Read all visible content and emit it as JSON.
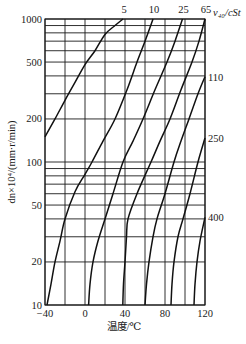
{
  "chart_data": {
    "type": "line",
    "title": "",
    "xlabel": "温度/℃",
    "ylabel": "dn×10⁴/(mm·r/min)",
    "xscale": "linear",
    "yscale": "log",
    "xlim": [
      -40,
      120
    ],
    "ylim": [
      10,
      1000
    ],
    "x_ticks": [
      -40,
      0,
      40,
      80,
      120
    ],
    "x_tick_labels": [
      "−40",
      "0",
      "40",
      "80",
      "120"
    ],
    "x_gridlines": [
      -40,
      -20,
      0,
      20,
      40,
      60,
      80,
      100,
      120
    ],
    "y_ticks": [
      10,
      20,
      50,
      100,
      200,
      500,
      1000
    ],
    "y_tick_labels": [
      "10",
      "20",
      "50",
      "100",
      "200",
      "500",
      "1000"
    ],
    "y_gridlines": [
      10,
      20,
      30,
      40,
      50,
      60,
      70,
      80,
      90,
      100,
      200,
      300,
      400,
      500,
      600,
      700,
      800,
      900,
      1000
    ],
    "grid": true,
    "legend_title": "ν₄₀/cSt",
    "series": [
      {
        "name": "5",
        "label_position": "top",
        "points": [
          [
            -40,
            150
          ],
          [
            -30,
            200
          ],
          [
            -20,
            270
          ],
          [
            -10,
            360
          ],
          [
            0,
            480
          ],
          [
            10,
            600
          ],
          [
            20,
            780
          ],
          [
            30,
            900
          ],
          [
            38,
            1000
          ]
        ]
      },
      {
        "name": "10",
        "label_position": "top",
        "points": [
          [
            -38,
            10
          ],
          [
            -34,
            14
          ],
          [
            -30,
            20
          ],
          [
            -25,
            28
          ],
          [
            -20,
            40
          ],
          [
            -10,
            62
          ],
          [
            0,
            82
          ],
          [
            7,
            100
          ],
          [
            18,
            140
          ],
          [
            30,
            200
          ],
          [
            42,
            320
          ],
          [
            52,
            500
          ],
          [
            60,
            700
          ],
          [
            68,
            1000
          ]
        ]
      },
      {
        "name": "25",
        "label_position": "top",
        "points": [
          [
            3.6,
            10
          ],
          [
            5,
            14
          ],
          [
            8,
            20
          ],
          [
            13,
            28
          ],
          [
            20,
            40
          ],
          [
            28,
            60
          ],
          [
            38,
            100
          ],
          [
            48,
            140
          ],
          [
            58,
            200
          ],
          [
            70,
            320
          ],
          [
            82,
            500
          ],
          [
            90,
            700
          ],
          [
            97.5,
            1000
          ]
        ]
      },
      {
        "name": "65",
        "label_position": "top",
        "points": [
          [
            37.8,
            10
          ],
          [
            38.5,
            14
          ],
          [
            40,
            20
          ],
          [
            41.5,
            30
          ],
          [
            43,
            40
          ],
          [
            52,
            60
          ],
          [
            66,
            100
          ],
          [
            75,
            140
          ],
          [
            85,
            200
          ],
          [
            96,
            320
          ],
          [
            107,
            500
          ],
          [
            114,
            700
          ],
          [
            120,
            1000
          ]
        ]
      },
      {
        "name": "110",
        "label_position": "right",
        "points": [
          [
            60,
            10
          ],
          [
            61.5,
            14
          ],
          [
            64,
            20
          ],
          [
            68,
            30
          ],
          [
            72,
            40
          ],
          [
            80,
            60
          ],
          [
            89,
            100
          ],
          [
            96,
            140
          ],
          [
            104,
            200
          ],
          [
            113,
            300
          ],
          [
            120,
            395
          ]
        ]
      },
      {
        "name": "250",
        "label_position": "right",
        "points": [
          [
            86,
            10
          ],
          [
            87,
            14
          ],
          [
            89,
            20
          ],
          [
            93,
            30
          ],
          [
            98,
            40
          ],
          [
            105,
            60
          ],
          [
            113,
            100
          ],
          [
            120,
            147
          ]
        ]
      },
      {
        "name": "400",
        "label_position": "right",
        "points": [
          [
            109,
            10
          ],
          [
            110,
            14
          ],
          [
            112,
            20
          ],
          [
            115,
            28
          ],
          [
            120,
            41
          ]
        ]
      }
    ]
  }
}
